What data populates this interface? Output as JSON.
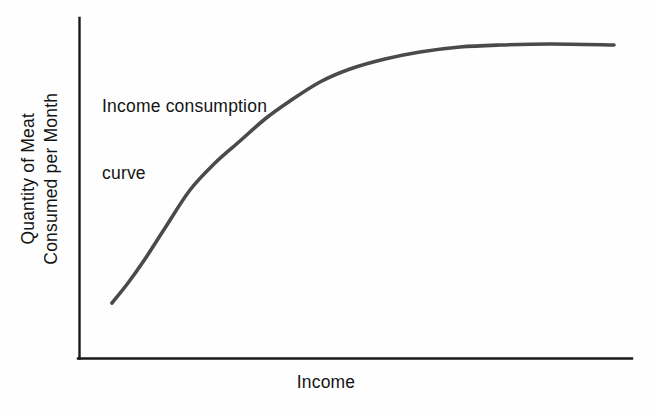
{
  "figure": {
    "background_color": "#fefefe",
    "axis_color": "#1a1a1a",
    "curve_color": "#4a4a4a",
    "text_color": "#141414"
  },
  "labels": {
    "y_axis_line1": "Quantity of Meat",
    "y_axis_line2": "Consumed per Month",
    "x_axis": "Income",
    "annotation_line1": "Income consumption",
    "annotation_line2": "curve"
  },
  "chart_data": {
    "type": "line",
    "title": "",
    "subtitle": "",
    "xlabel": "Income",
    "ylabel": "Quantity of Meat Consumed per Month",
    "xlim": [
      0,
      100
    ],
    "ylim": [
      0,
      100
    ],
    "grid": false,
    "legend": null,
    "axis_ticks": {
      "x": [],
      "y": []
    },
    "annotations": [
      {
        "text": "Income consumption curve",
        "x": 6,
        "y": 90,
        "lines": [
          "Income consumption",
          "curve"
        ]
      }
    ],
    "series": [
      {
        "name": "Income consumption curve",
        "color": "#4a4a4a",
        "x": [
          6,
          11,
          20,
          29,
          38,
          44,
          62,
          78,
          92,
          100
        ],
        "y": [
          16,
          27,
          49,
          63,
          76,
          81,
          88,
          91,
          92,
          92
        ],
        "shape": "concave-down increasing, saturating plateau"
      }
    ],
    "pixel_geometry": {
      "plot_origin_px": [
        79,
        358
      ],
      "x_axis_end_px": [
        632,
        358
      ],
      "y_axis_top_px": [
        79,
        18
      ],
      "curve_points_px": [
        [
          112,
          303
        ],
        [
          128,
          283
        ],
        [
          145,
          259
        ],
        [
          165,
          228
        ],
        [
          190,
          190
        ],
        [
          215,
          163
        ],
        [
          240,
          141
        ],
        [
          265,
          119
        ],
        [
          290,
          101
        ],
        [
          320,
          82
        ],
        [
          350,
          69
        ],
        [
          385,
          59
        ],
        [
          420,
          52
        ],
        [
          460,
          47
        ],
        [
          500,
          45
        ],
        [
          550,
          44
        ],
        [
          614,
          45
        ]
      ]
    }
  }
}
